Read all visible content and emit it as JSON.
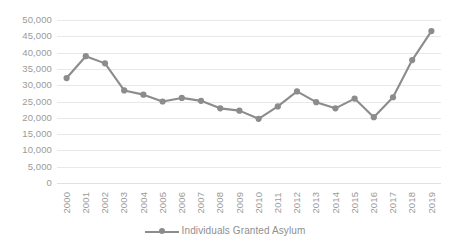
{
  "chart_data": {
    "type": "line",
    "title": "",
    "subtitle": "",
    "xlabel": "",
    "ylabel": "",
    "ylim": [
      0,
      50000
    ],
    "grid": true,
    "legend_position": "bottom",
    "categories": [
      "2000",
      "2001",
      "2002",
      "2003",
      "2004",
      "2005",
      "2006",
      "2007",
      "2008",
      "2009",
      "2010",
      "2011",
      "2012",
      "2013",
      "2014",
      "2015",
      "2016",
      "2017",
      "2018",
      "2019"
    ],
    "series": [
      {
        "name": "Individuals Granted Asylum",
        "color": "#8c8c8c",
        "marker": "circle",
        "values": [
          32200,
          38900,
          36700,
          28400,
          27100,
          25000,
          26100,
          25200,
          22900,
          22200,
          19700,
          23500,
          28100,
          24800,
          22900,
          25900,
          20200,
          26300,
          37700,
          46600
        ]
      }
    ],
    "y_ticks": [
      {
        "value": 50000,
        "label": "50,000"
      },
      {
        "value": 45000,
        "label": "45,000"
      },
      {
        "value": 40000,
        "label": "40,000"
      },
      {
        "value": 35000,
        "label": "35,000"
      },
      {
        "value": 30000,
        "label": "30,000"
      },
      {
        "value": 25000,
        "label": "25,000"
      },
      {
        "value": 20000,
        "label": "20,000"
      },
      {
        "value": 15000,
        "label": "15,000"
      },
      {
        "value": 10000,
        "label": "10,000"
      },
      {
        "value": 5000,
        "label": "5,000"
      },
      {
        "value": 0,
        "label": "0"
      }
    ],
    "colors": {
      "series": "#8c8c8c",
      "gridline": "#e8e8e8",
      "tick_text": "#9a9a9a",
      "legend_text": "#8f8f8f",
      "background": "#ffffff"
    }
  },
  "legend": {
    "entries": [
      {
        "label": "Individuals Granted Asylum"
      }
    ]
  }
}
